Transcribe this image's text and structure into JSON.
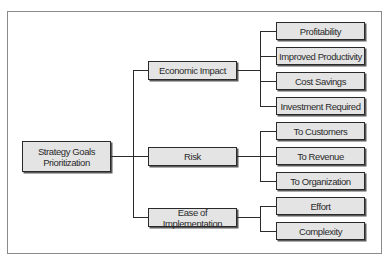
{
  "diagram": {
    "type": "tree",
    "root": {
      "label": "Strategy Goals Prioritization",
      "label_line1": "Strategy Goals",
      "label_line2": "Prioritization"
    },
    "categories": [
      {
        "label": "Economic Impact",
        "children": [
          {
            "label": "Profitability"
          },
          {
            "label": "Improved Productivity"
          },
          {
            "label": "Cost Savings"
          },
          {
            "label": "Investment Required"
          }
        ]
      },
      {
        "label": "Risk",
        "children": [
          {
            "label": "To Customers"
          },
          {
            "label": "To Revenue"
          },
          {
            "label": "To Organization"
          }
        ]
      },
      {
        "label": "Ease of Implementation",
        "children": [
          {
            "label": "Effort"
          },
          {
            "label": "Complexity"
          }
        ]
      }
    ],
    "colors": {
      "box_fill": "#e4e4e4",
      "box_border": "#2a2a2a",
      "connector": "#2a2a2a",
      "frame_border": "#8a8a8a"
    }
  }
}
